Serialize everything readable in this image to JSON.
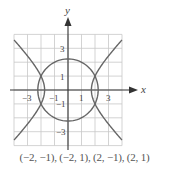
{
  "figure": {
    "axis_labels": {
      "x": "x",
      "y": "y"
    },
    "x_tick_labels": [
      "−3",
      "−1",
      "1",
      "3"
    ],
    "y_tick_labels": [
      "3",
      "1",
      "−1",
      "−3"
    ],
    "grid": {
      "xmin": -4,
      "xmax": 4,
      "ymin": -4,
      "ymax": 4,
      "step": 1
    },
    "curves": [
      {
        "name": "circle",
        "equation": "x^2 + y^2 = 5",
        "color": "#666666"
      },
      {
        "name": "hyperbola",
        "equation": "x^2 - y^2 = 3",
        "color": "#666666"
      }
    ],
    "intersection_points": [
      [
        -2,
        -1
      ],
      [
        -2,
        1
      ],
      [
        2,
        -1
      ],
      [
        2,
        1
      ]
    ],
    "caption": "(−2, −1), (−2, 1), (2, −1), (2, 1)"
  }
}
